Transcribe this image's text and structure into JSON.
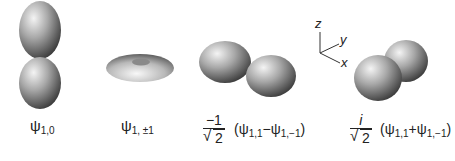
{
  "figure": {
    "orbitals": [
      {
        "id": "psi_1_0",
        "label_symbol": "ψ",
        "label_sub": "1,0",
        "shape": "dumbbell-vertical"
      },
      {
        "id": "psi_1_pm1",
        "label_symbol": "ψ",
        "label_sub": "1, ±1",
        "shape": "torus"
      },
      {
        "id": "px",
        "coef_num": "−1",
        "coef_den": "2",
        "expr_open": "(ψ",
        "sub1": "1,1",
        "op": "−",
        "psi2": "ψ",
        "sub2": "1,−1",
        "expr_close": ")",
        "shape": "dumbbell-x"
      },
      {
        "id": "py",
        "coef_num": "i",
        "coef_den": "2",
        "expr_open": "(ψ",
        "sub1": "1,1",
        "op": "+",
        "psi2": "ψ",
        "sub2": "1,−1",
        "expr_close": ")",
        "shape": "dumbbell-y"
      }
    ],
    "axes": {
      "z": "z",
      "y": "y",
      "x": "x"
    }
  }
}
